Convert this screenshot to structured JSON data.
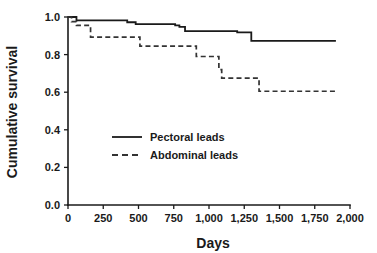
{
  "chart_data": {
    "type": "line",
    "subtype": "kaplan-meier-step",
    "title": "",
    "xlabel": "Days",
    "ylabel": "Cumulative survival",
    "xlim": [
      0,
      2000
    ],
    "ylim": [
      0.0,
      1.0
    ],
    "grid": false,
    "legend_position": "center-left-inside",
    "xticks": [
      0,
      250,
      500,
      750,
      1000,
      1250,
      1500,
      1750,
      2000
    ],
    "xtick_labels": [
      "0",
      "250",
      "500",
      "750",
      "1,000",
      "1,250",
      "1,500",
      "1,750",
      "2,000"
    ],
    "yticks": [
      0.0,
      0.2,
      0.4,
      0.6,
      0.8,
      1.0
    ],
    "ytick_labels": [
      "0.0",
      "0.2",
      "0.4",
      "0.6",
      "0.8",
      "1.0"
    ],
    "series": [
      {
        "name": "Pectoral leads",
        "style": "solid",
        "color": "#1a1a1a",
        "x": [
          0,
          30,
          60,
          330,
          420,
          480,
          700,
          760,
          790,
          830,
          1160,
          1200,
          1270,
          1300,
          1900
        ],
        "y": [
          1.0,
          1.0,
          0.982,
          0.982,
          0.972,
          0.962,
          0.962,
          0.955,
          0.948,
          0.925,
          0.925,
          0.918,
          0.918,
          0.873,
          0.873
        ]
      },
      {
        "name": "Abdominal leads",
        "style": "dashed",
        "color": "#333333",
        "x": [
          0,
          25,
          60,
          140,
          160,
          490,
          510,
          890,
          910,
          1040,
          1070,
          1090,
          1330,
          1355,
          1900
        ],
        "y": [
          1.0,
          0.975,
          0.955,
          0.955,
          0.893,
          0.893,
          0.845,
          0.845,
          0.79,
          0.79,
          0.72,
          0.675,
          0.675,
          0.605,
          0.605
        ]
      }
    ]
  },
  "legend": {
    "items": [
      {
        "label": "Pectoral leads",
        "style": "solid"
      },
      {
        "label": "Abdominal leads",
        "style": "dashed"
      }
    ]
  },
  "axes": {
    "x_title": "Days",
    "y_title": "Cumulative survival",
    "x_labels": [
      "0",
      "250",
      "500",
      "750",
      "1,000",
      "1,250",
      "1,500",
      "1,750",
      "2,000"
    ],
    "y_labels": [
      "1.0",
      "0.8",
      "0.6",
      "0.4",
      "0.2",
      "0.0"
    ]
  },
  "colors": {
    "axis": "#1a1a1a",
    "background": "#ffffff",
    "series_pectoral": "#1a1a1a",
    "series_abdominal": "#333333"
  }
}
